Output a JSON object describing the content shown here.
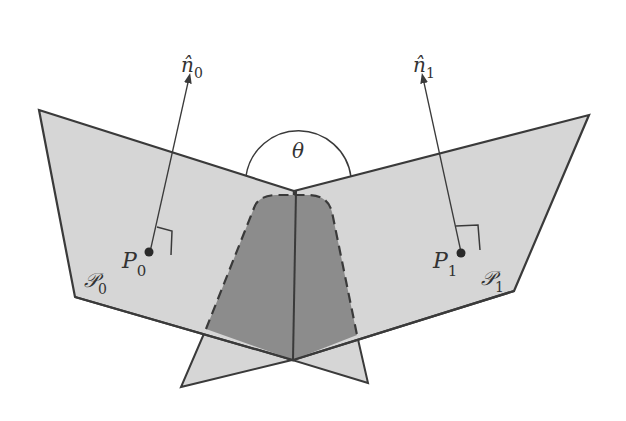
{
  "diagram": {
    "colors": {
      "plane_fill": "#d6d6d6",
      "overlap_fill": "#8c8c8c",
      "stroke": "#3a3a3a",
      "background": "#ffffff"
    },
    "labels": {
      "normal0": {
        "base": "n̂",
        "sub": "0"
      },
      "normal1": {
        "base": "n̂",
        "sub": "1"
      },
      "angle": "θ",
      "point0": {
        "base": "P",
        "sub": "0"
      },
      "point1": {
        "base": "P",
        "sub": "1"
      },
      "plane0": {
        "base": "𝒫",
        "sub": "0"
      },
      "plane1": {
        "base": "𝒫",
        "sub": "1"
      }
    }
  }
}
